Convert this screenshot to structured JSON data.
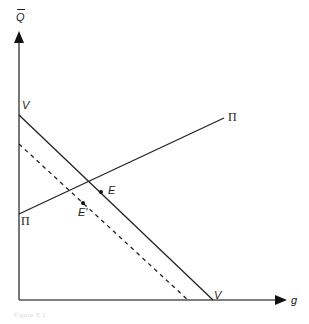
{
  "diagram": {
    "y_axis_label": "Q",
    "x_axis_label": "g",
    "lines": [
      {
        "name": "V",
        "style": "solid",
        "start_label": "V",
        "end_label": "V",
        "from": [
          19,
          115
        ],
        "to": [
          213,
          300
        ]
      },
      {
        "name": "V-shifted",
        "style": "dashed",
        "from": [
          19,
          144
        ],
        "to": [
          188,
          300
        ]
      },
      {
        "name": "Pi",
        "style": "solid",
        "start_label": "Π",
        "end_label": "Π",
        "from": [
          19,
          214
        ],
        "to": [
          224,
          118
        ]
      }
    ],
    "points": [
      {
        "label": "E",
        "x": 101,
        "y": 192
      },
      {
        "label": "E'",
        "x": 83,
        "y": 203
      }
    ],
    "caption": "Figure 5.1"
  }
}
